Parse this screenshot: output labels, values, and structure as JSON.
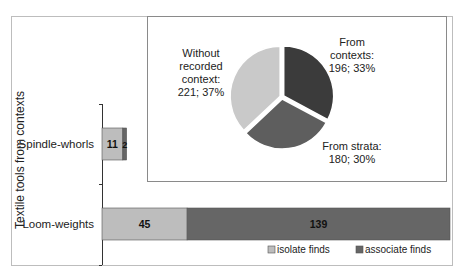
{
  "chart_data": [
    {
      "type": "bar",
      "orientation": "horizontal",
      "stacked": true,
      "ylabel": "Textile tools from contexts",
      "categories": [
        "Spindle-whorls",
        "Loom-weights"
      ],
      "series": [
        {
          "name": "isolate finds",
          "values": [
            11,
            45
          ],
          "color": "#bdbdbd"
        },
        {
          "name": "associate finds",
          "values": [
            2,
            139
          ],
          "color": "#666666"
        }
      ],
      "xlim": [
        0,
        184
      ],
      "legend": "bottom",
      "data_labels": true
    },
    {
      "type": "pie",
      "slices": [
        {
          "label": "From contexts:",
          "value": 196,
          "percent": "33%",
          "text": "196; 33%",
          "color": "#3b3b3b"
        },
        {
          "label": "From strata:",
          "value": 180,
          "percent": "30%",
          "text": "180; 30%",
          "color": "#5e5e5e"
        },
        {
          "label": "Without recorded context:",
          "value": 221,
          "percent": "37%",
          "text": "221; 37%",
          "color": "#c9c9c9"
        }
      ]
    }
  ]
}
